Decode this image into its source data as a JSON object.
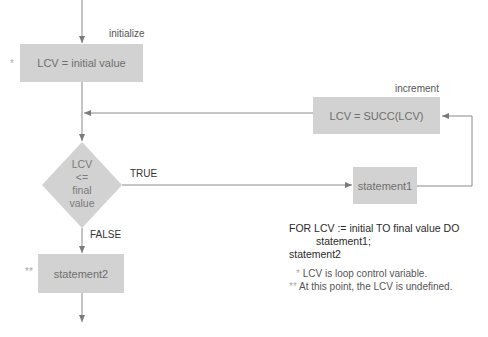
{
  "diagram": {
    "type": "flowchart",
    "colors": {
      "box_fill": "#d2d2d2",
      "line": "#8a8a8a",
      "box_text": "#6e6e6e"
    },
    "nodes": {
      "init": {
        "text": "LCV = initial value",
        "label": "initialize",
        "marker": "*"
      },
      "increment": {
        "text": "LCV = SUCC(LCV)",
        "label": "increment"
      },
      "decision": {
        "lines": [
          "LCV",
          "<=",
          "final",
          "value"
        ]
      },
      "statement1": {
        "text": "statement1"
      },
      "statement2": {
        "text": "statement2",
        "marker": "**"
      }
    },
    "edges": {
      "true_label": "TRUE",
      "false_label": "FALSE"
    }
  },
  "code": {
    "line1": "FOR LCV := initial TO final value DO",
    "line2": "statement1;",
    "line3": "statement2"
  },
  "notes": [
    {
      "marker": "*",
      "text": "LCV is loop control variable."
    },
    {
      "marker": "**",
      "text": "At this point, the LCV is undefined."
    }
  ]
}
